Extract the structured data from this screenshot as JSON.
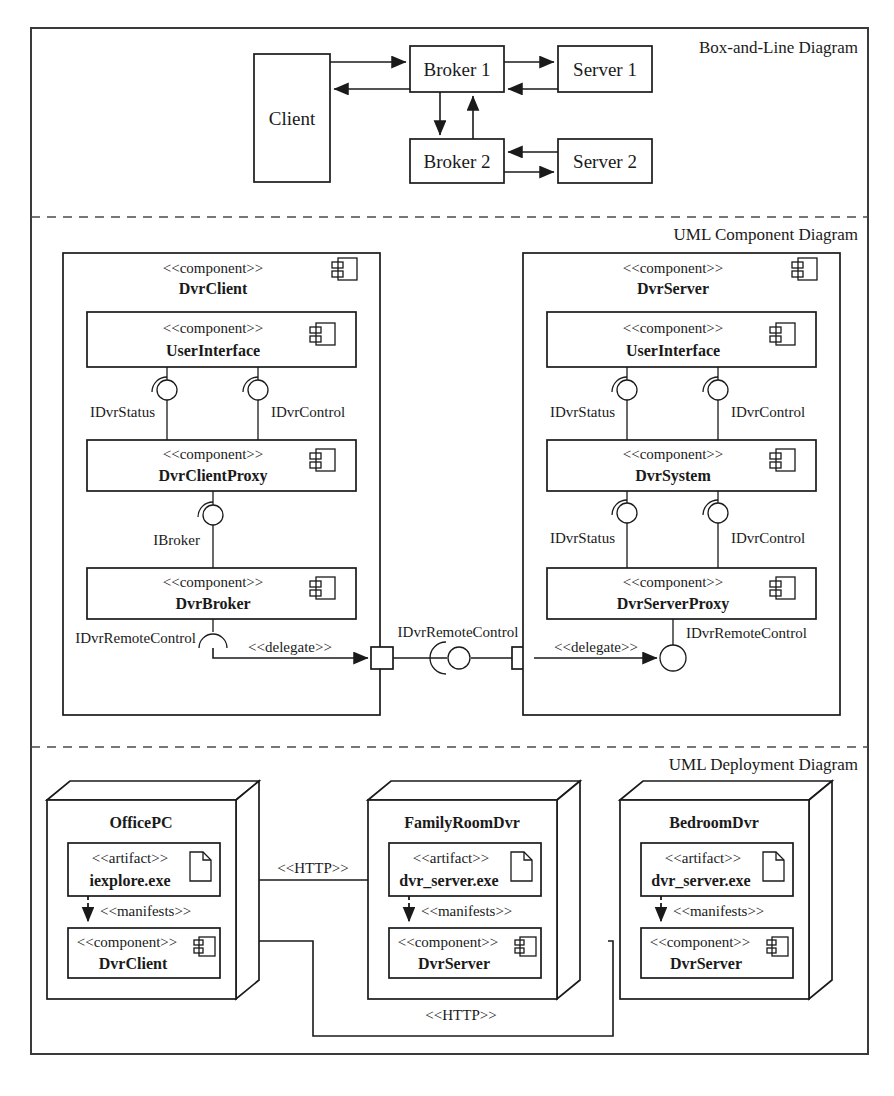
{
  "figure": {
    "sections": [
      {
        "id": "box-and-line",
        "title": "Box-and-Line Diagram"
      },
      {
        "id": "uml-component",
        "title": "UML Component Diagram"
      },
      {
        "id": "uml-deployment",
        "title": "UML Deployment Diagram"
      }
    ]
  },
  "box_and_line": {
    "nodes": [
      {
        "id": "client",
        "label": "Client"
      },
      {
        "id": "broker1",
        "label": "Broker 1"
      },
      {
        "id": "server1",
        "label": "Server 1"
      },
      {
        "id": "broker2",
        "label": "Broker 2"
      },
      {
        "id": "server2",
        "label": "Server 2"
      }
    ],
    "arrows": [
      {
        "from": "client",
        "to": "broker1"
      },
      {
        "from": "broker1",
        "to": "client"
      },
      {
        "from": "broker1",
        "to": "server1"
      },
      {
        "from": "server1",
        "to": "broker1"
      },
      {
        "from": "broker1",
        "to": "broker2"
      },
      {
        "from": "broker2",
        "to": "broker1"
      },
      {
        "from": "server2",
        "to": "broker2"
      },
      {
        "from": "broker2",
        "to": "server2"
      }
    ]
  },
  "component_diagram": {
    "stereotype": "<<component>>",
    "delegate_label": "<<delegate>>",
    "client": {
      "name": "DvrClient",
      "children": [
        {
          "name": "UserInterface"
        },
        {
          "name": "DvrClientProxy"
        },
        {
          "name": "DvrBroker"
        }
      ],
      "interfaces": [
        {
          "name": "IDvrStatus"
        },
        {
          "name": "IDvrControl"
        },
        {
          "name": "IBroker"
        },
        {
          "name": "IDvrRemoteControl"
        }
      ]
    },
    "server": {
      "name": "DvrServer",
      "children": [
        {
          "name": "UserInterface"
        },
        {
          "name": "DvrSystem"
        },
        {
          "name": "DvrServerProxy"
        }
      ],
      "interfaces": [
        {
          "name": "IDvrStatus"
        },
        {
          "name": "IDvrControl"
        },
        {
          "name": "IDvrStatus"
        },
        {
          "name": "IDvrControl"
        },
        {
          "name": "IDvrRemoteControl"
        }
      ]
    },
    "assembly_interface": "IDvrRemoteControl"
  },
  "deployment_diagram": {
    "artifact_stereotype": "<<artifact>>",
    "component_stereotype": "<<component>>",
    "manifests_label": "<<manifests>>",
    "http_label": "<<HTTP>>",
    "nodes": [
      {
        "name": "OfficePC",
        "artifact": "iexplore.exe",
        "component": "DvrClient"
      },
      {
        "name": "FamilyRoomDvr",
        "artifact": "dvr_server.exe",
        "component": "DvrServer"
      },
      {
        "name": "BedroomDvr",
        "artifact": "dvr_server.exe",
        "component": "DvrServer"
      }
    ],
    "connections": [
      {
        "label": "<<HTTP>>",
        "from": "OfficePC",
        "to": "FamilyRoomDvr"
      },
      {
        "label": "<<HTTP>>",
        "from": "OfficePC",
        "to": "BedroomDvr"
      }
    ]
  },
  "colors": {
    "ink": "#1a1a1a",
    "frame": "#3a3a3a",
    "paper": "#ffffff"
  }
}
